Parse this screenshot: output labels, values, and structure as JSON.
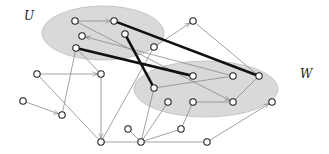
{
  "diagram": {
    "title": "",
    "colors": {
      "set_fill": "#d9d9d9",
      "set_stroke": "#bdbdbd",
      "edge": "#8a8a8a",
      "thick_edge": "#111111",
      "node_fill": "#ffffff",
      "node_stroke": "#222222"
    },
    "sets": [
      {
        "id": "U",
        "label": "U",
        "cx": 103,
        "cy": 33,
        "rx": 61,
        "ry": 27,
        "label_x": 24,
        "label_y": 20
      },
      {
        "id": "W",
        "label": "W",
        "cx": 206,
        "cy": 89,
        "rx": 72,
        "ry": 28,
        "label_x": 300,
        "label_y": 78
      }
    ],
    "nodes": [
      {
        "id": "A",
        "x": 75,
        "y": 21
      },
      {
        "id": "B",
        "x": 114,
        "y": 21
      },
      {
        "id": "C",
        "x": 82,
        "y": 36
      },
      {
        "id": "D",
        "x": 125,
        "y": 34
      },
      {
        "id": "E",
        "x": 76,
        "y": 48
      },
      {
        "id": "H",
        "x": 154,
        "y": 47
      },
      {
        "id": "I",
        "x": 193,
        "y": 21
      },
      {
        "id": "F",
        "x": 37,
        "y": 74
      },
      {
        "id": "G",
        "x": 101,
        "y": 74
      },
      {
        "id": "J",
        "x": 193,
        "y": 76
      },
      {
        "id": "K",
        "x": 233,
        "y": 76
      },
      {
        "id": "L",
        "x": 259,
        "y": 76
      },
      {
        "id": "R",
        "x": 154,
        "y": 88
      },
      {
        "id": "M",
        "x": 23,
        "y": 101
      },
      {
        "id": "N",
        "x": 62,
        "y": 115
      },
      {
        "id": "S",
        "x": 168,
        "y": 102
      },
      {
        "id": "T",
        "x": 193,
        "y": 102
      },
      {
        "id": "V",
        "x": 233,
        "y": 102
      },
      {
        "id": "X",
        "x": 272,
        "y": 102
      },
      {
        "id": "P",
        "x": 128,
        "y": 129
      },
      {
        "id": "Y",
        "x": 181,
        "y": 129
      },
      {
        "id": "O",
        "x": 101,
        "y": 142
      },
      {
        "id": "Q",
        "x": 141,
        "y": 142
      },
      {
        "id": "Z",
        "x": 207,
        "y": 142
      }
    ],
    "edges": [
      {
        "from": "A",
        "to": "B",
        "arrow": true,
        "thick": false
      },
      {
        "from": "A",
        "to": "V",
        "arrow": true,
        "thick": false
      },
      {
        "from": "B",
        "to": "L",
        "arrow": false,
        "thick": true
      },
      {
        "from": "D",
        "to": "R",
        "arrow": false,
        "thick": true
      },
      {
        "from": "E",
        "to": "J",
        "arrow": false,
        "thick": true
      },
      {
        "from": "K",
        "to": "C",
        "arrow": true,
        "thick": false
      },
      {
        "from": "E",
        "to": "G",
        "arrow": false,
        "thick": false
      },
      {
        "from": "E",
        "to": "N",
        "arrow": false,
        "thick": false
      },
      {
        "from": "H",
        "to": "I",
        "arrow": true,
        "thick": false
      },
      {
        "from": "I",
        "to": "L",
        "arrow": false,
        "thick": false
      },
      {
        "from": "H",
        "to": "O",
        "arrow": false,
        "thick": false
      },
      {
        "from": "F",
        "to": "G",
        "arrow": true,
        "thick": false
      },
      {
        "from": "F",
        "to": "O",
        "arrow": false,
        "thick": false
      },
      {
        "from": "M",
        "to": "N",
        "arrow": true,
        "thick": false
      },
      {
        "from": "G",
        "to": "O",
        "arrow": true,
        "thick": false
      },
      {
        "from": "R",
        "to": "K",
        "arrow": false,
        "thick": false
      },
      {
        "from": "L",
        "to": "V",
        "arrow": false,
        "thick": false
      },
      {
        "from": "T",
        "to": "V",
        "arrow": false,
        "thick": false
      },
      {
        "from": "O",
        "to": "Q",
        "arrow": false,
        "thick": false
      },
      {
        "from": "P",
        "to": "Q",
        "arrow": false,
        "thick": false
      },
      {
        "from": "Q",
        "to": "R",
        "arrow": false,
        "thick": false
      },
      {
        "from": "Q",
        "to": "S",
        "arrow": false,
        "thick": false
      },
      {
        "from": "Q",
        "to": "Y",
        "arrow": false,
        "thick": false
      },
      {
        "from": "Q",
        "to": "Z",
        "arrow": false,
        "thick": false
      },
      {
        "from": "Y",
        "to": "T",
        "arrow": false,
        "thick": false
      },
      {
        "from": "Z",
        "to": "X",
        "arrow": true,
        "thick": false
      }
    ]
  }
}
